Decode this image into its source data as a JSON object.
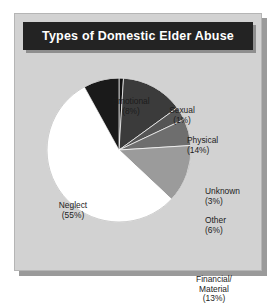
{
  "figure": {
    "title": "Types of Domestic Elder Abuse",
    "background_color": "#ffffff",
    "panel_color": "#d2d2d2",
    "title_bar_color": "#232323",
    "title_text_color": "#ffffff"
  },
  "chart_data": {
    "type": "pie",
    "title": "Types of Domestic Elder Abuse",
    "xlabel": "",
    "ylabel": "",
    "units": "percent",
    "start_angle_deg": 0,
    "direction": "clockwise",
    "legend": "none",
    "grid": false,
    "categories": [
      "Sexual",
      "Physical",
      "Unknown",
      "Other",
      "Financial/Material",
      "Neglect",
      "Emotional"
    ],
    "values": [
      1,
      14,
      3,
      6,
      13,
      55,
      8
    ],
    "slices": [
      {
        "label": "Sexual",
        "label_line1": "Sexual",
        "value": 1,
        "pct_text": "(1%)",
        "color": "#111111"
      },
      {
        "label": "Physical",
        "label_line1": "Physical",
        "value": 14,
        "pct_text": "(14%)",
        "color": "#3b3b3b"
      },
      {
        "label": "Unknown",
        "label_line1": "Unknown",
        "value": 3,
        "pct_text": "(3%)",
        "color": "#555555"
      },
      {
        "label": "Other",
        "label_line1": "Other",
        "value": 6,
        "pct_text": "(6%)",
        "color": "#6e6e6e"
      },
      {
        "label": "Financial/Material",
        "label_line1": "Financial/",
        "label_line2": "Material",
        "value": 13,
        "pct_text": "(13%)",
        "color": "#9b9b9b"
      },
      {
        "label": "Neglect",
        "label_line1": "Neglect",
        "value": 55,
        "pct_text": "(55%)",
        "color": "#ffffff"
      },
      {
        "label": "Emotional",
        "label_line1": "Emotional",
        "value": 8,
        "pct_text": "(8%)",
        "color": "#1a1a1a"
      }
    ]
  }
}
